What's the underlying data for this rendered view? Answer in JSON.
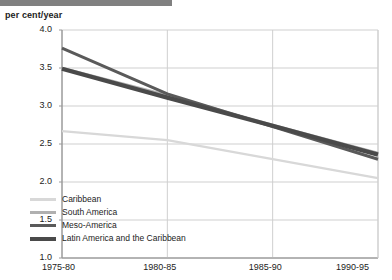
{
  "header": {
    "bar_color": "#808080"
  },
  "axis_unit_label": "per cent/year",
  "chart_data": {
    "type": "line",
    "title": "",
    "subtitle": "",
    "xlabel": "",
    "ylabel": "per cent/year",
    "categories": [
      "1975-80",
      "1980-85",
      "1985-90",
      "1990-95"
    ],
    "ylim": [
      1.0,
      4.0
    ],
    "ytick_labels": [
      "1.0",
      "1.5",
      "2.0",
      "2.5",
      "3.0",
      "3.5",
      "4.0"
    ],
    "ytick_values": [
      1.0,
      1.5,
      2.0,
      2.5,
      3.0,
      3.5,
      4.0
    ],
    "grid": true,
    "legend_position": "bottom-left",
    "series": [
      {
        "name": "Caribbean",
        "color": "#d8d8d8",
        "width": 2.2,
        "values": [
          2.67,
          2.55,
          2.3,
          2.05
        ]
      },
      {
        "name": "South America",
        "color": "#b0b0b0",
        "width": 2.6,
        "values": [
          3.5,
          3.14,
          2.75,
          2.38
        ]
      },
      {
        "name": "Meso-America",
        "color": "#5a5a5a",
        "width": 3.0,
        "values": [
          3.76,
          3.16,
          2.73,
          2.3
        ]
      },
      {
        "name": "Latin America and the Caribbean",
        "color": "#4a4a4a",
        "width": 4.2,
        "values": [
          3.49,
          3.11,
          2.74,
          2.36
        ]
      }
    ]
  },
  "colors": {
    "gridline": "#cfcfcf",
    "axis": "#9a9a9a",
    "text": "#1c1c1c"
  }
}
